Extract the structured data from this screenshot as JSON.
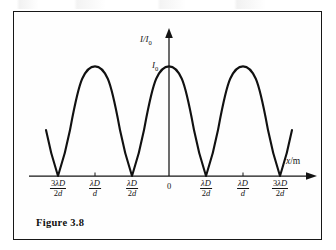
{
  "figure": {
    "caption": "Figure 3.8",
    "border_color": "#171717",
    "background": "#ffffff",
    "curve_color": "#111111"
  },
  "axes": {
    "y_label": "I/I",
    "y_label_sub": "0",
    "x_label_var": "x",
    "x_label_unit": "/m",
    "peak_label": "I",
    "peak_label_sub": "0"
  },
  "ticks": [
    {
      "id": "tick-neg-3lambdaD-2d",
      "num": "3λD",
      "den": "2d",
      "x": 57,
      "kind": "fraction"
    },
    {
      "id": "tick-neg-lambdaD-d",
      "num": "λD",
      "den": "d",
      "x": 94,
      "kind": "fraction"
    },
    {
      "id": "tick-neg-lambdaD-2d",
      "num": "λD",
      "den": "2d",
      "x": 131,
      "kind": "fraction"
    },
    {
      "id": "tick-zero",
      "num": "0",
      "den": "",
      "x": 168,
      "kind": "zero"
    },
    {
      "id": "tick-pos-lambdaD-2d",
      "num": "λD",
      "den": "2d",
      "x": 205,
      "kind": "fraction"
    },
    {
      "id": "tick-pos-lambdaD-d",
      "num": "λD",
      "den": "d",
      "x": 242,
      "kind": "fraction"
    },
    {
      "id": "tick-pos-3lambdaD-2d",
      "num": "3λD",
      "den": "2d",
      "x": 279,
      "kind": "fraction"
    }
  ],
  "chart_data": {
    "type": "line",
    "title": "Figure 3.8",
    "subtitle": "Young's double-slit intensity distribution",
    "xlabel": "x/m",
    "ylabel": "I/I0",
    "grid": false,
    "legend": null,
    "axis_arrows": {
      "x": "right",
      "y": "up"
    },
    "x_tick_labels": [
      "3λD/2d",
      "λD/d",
      "λD/2d",
      "0",
      "λD/2d",
      "λD/d",
      "3λD/2d"
    ],
    "x_tick_values": [
      -1.5,
      -1.0,
      -0.5,
      0,
      0.5,
      1.0,
      1.5
    ],
    "y_tick_labels": [
      "I0"
    ],
    "y_tick_values": [
      1.0
    ],
    "ylim": [
      0,
      1.12
    ],
    "xlim": [
      -1.72,
      1.72
    ],
    "function": "I = I0 * cos^2(pi * x * d / (lambda * D))",
    "maxima_x": [
      -1.0,
      0,
      1.0
    ],
    "maxima_y": [
      1.0,
      1.0,
      1.0
    ],
    "minima_x": [
      -1.5,
      -0.5,
      0.5,
      1.5
    ],
    "minima_y": [
      0,
      0,
      0,
      0
    ],
    "series": [
      {
        "name": "I/I0",
        "x": [
          -1.72,
          -1.6,
          -1.5,
          -1.4,
          -1.3,
          -1.2,
          -1.1,
          -1.0,
          -0.9,
          -0.8,
          -0.7,
          -0.6,
          -0.5,
          -0.4,
          -0.3,
          -0.2,
          -0.1,
          0.0,
          0.1,
          0.2,
          0.3,
          0.4,
          0.5,
          0.6,
          0.7,
          0.8,
          0.9,
          1.0,
          1.1,
          1.2,
          1.3,
          1.4,
          1.5,
          1.6,
          1.72
        ],
        "values": [
          0.45,
          0.1,
          0.0,
          0.1,
          0.35,
          0.65,
          0.9,
          1.0,
          0.9,
          0.65,
          0.35,
          0.1,
          0.0,
          0.1,
          0.35,
          0.65,
          0.9,
          1.0,
          0.9,
          0.65,
          0.35,
          0.1,
          0.0,
          0.1,
          0.35,
          0.65,
          0.9,
          1.0,
          0.9,
          0.65,
          0.35,
          0.1,
          0.0,
          0.1,
          0.45
        ]
      }
    ]
  }
}
